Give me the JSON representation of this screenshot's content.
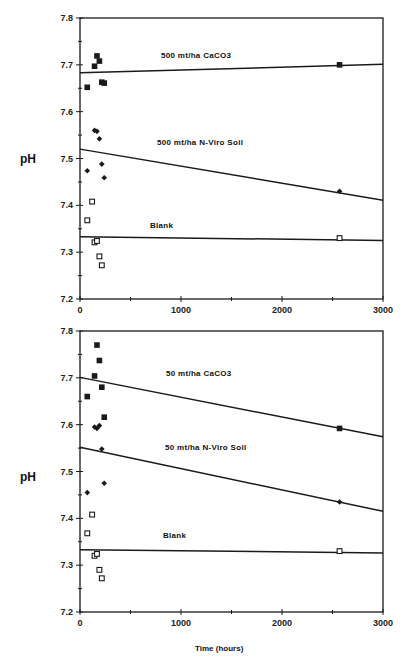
{
  "chart_data": [
    {
      "type": "scatter",
      "title": "",
      "xlabel": "",
      "ylabel": "pH",
      "xlim": [
        0,
        3000
      ],
      "ylim": [
        7.2,
        7.8
      ],
      "xticks": [
        "0",
        "1000",
        "2000",
        "3000"
      ],
      "yticks": [
        "7.2",
        "7.3",
        "7.4",
        "7.5",
        "7.6",
        "7.7",
        "7.8"
      ],
      "grid": false,
      "annotations": [
        "500  mt/ha  CaCO3",
        "500  mt/ha  N-Viro  Soil",
        "Blank"
      ],
      "series": [
        {
          "name": "500 mt/ha CaCO3",
          "marker": "filled-square",
          "x": [
            72,
            144,
            168,
            192,
            216,
            240,
            2570
          ],
          "y": [
            7.652,
            7.697,
            7.719,
            7.708,
            7.663,
            7.661,
            7.7
          ],
          "fit_line": {
            "x": [
              0,
              3000
            ],
            "y": [
              7.683,
              7.701
            ]
          }
        },
        {
          "name": "500 mt/ha N-Viro Soil",
          "marker": "filled-diamond",
          "x": [
            72,
            144,
            168,
            192,
            216,
            240,
            2570
          ],
          "y": [
            7.474,
            7.56,
            7.558,
            7.542,
            7.488,
            7.459,
            7.43
          ],
          "fit_line": {
            "x": [
              0,
              3000
            ],
            "y": [
              7.52,
              7.411
            ]
          }
        },
        {
          "name": "Blank",
          "marker": "open-square",
          "x": [
            72,
            120,
            144,
            168,
            192,
            216,
            2570
          ],
          "y": [
            7.368,
            7.408,
            7.321,
            7.324,
            7.291,
            7.272,
            7.33
          ],
          "fit_line": {
            "x": [
              0,
              3000
            ],
            "y": [
              7.333,
              7.325
            ]
          }
        }
      ]
    },
    {
      "type": "scatter",
      "title": "",
      "xlabel": "Time  (hours)",
      "ylabel": "pH",
      "xlim": [
        0,
        3000
      ],
      "ylim": [
        7.2,
        7.8
      ],
      "xticks": [
        "0",
        "1000",
        "2000",
        "3000"
      ],
      "yticks": [
        "7.2",
        "7.3",
        "7.4",
        "7.5",
        "7.6",
        "7.7",
        "7.8"
      ],
      "grid": false,
      "annotations": [
        "50  mt/ha  CaCO3",
        "50  mt/ha  N-Viro  Soil",
        "Blank"
      ],
      "series": [
        {
          "name": "50 mt/ha CaCO3",
          "marker": "filled-square",
          "x": [
            72,
            144,
            168,
            192,
            216,
            240,
            2570
          ],
          "y": [
            7.66,
            7.704,
            7.77,
            7.737,
            7.68,
            7.616,
            7.592
          ],
          "fit_line": {
            "x": [
              0,
              3000
            ],
            "y": [
              7.701,
              7.574
            ]
          }
        },
        {
          "name": "50 mt/ha N-Viro Soil",
          "marker": "filled-diamond",
          "x": [
            72,
            144,
            168,
            192,
            216,
            240,
            2570
          ],
          "y": [
            7.455,
            7.595,
            7.592,
            7.598,
            7.548,
            7.475,
            7.435
          ],
          "fit_line": {
            "x": [
              0,
              3000
            ],
            "y": [
              7.552,
              7.415
            ]
          }
        },
        {
          "name": "Blank",
          "marker": "open-square",
          "x": [
            72,
            120,
            144,
            168,
            192,
            216,
            2570
          ],
          "y": [
            7.368,
            7.408,
            7.32,
            7.324,
            7.29,
            7.272,
            7.33
          ],
          "fit_line": {
            "x": [
              0,
              3000
            ],
            "y": [
              7.333,
              7.326
            ]
          }
        }
      ]
    }
  ],
  "panels": [
    {
      "ylabel": "pH",
      "labels": {
        "caco3": "500  mt/ha  CaCO3",
        "nviro": "500  mt/ha  N-Viro  Soil",
        "blank": "Blank"
      }
    },
    {
      "ylabel": "pH",
      "labels": {
        "caco3": "50  mt/ha  CaCO3",
        "nviro": "50  mt/ha  N-Viro  Soil",
        "blank": "Blank"
      }
    }
  ],
  "axis": {
    "xticks": [
      "0",
      "1000",
      "2000",
      "3000"
    ],
    "yticks": [
      "7.2",
      "7.3",
      "7.4",
      "7.5",
      "7.6",
      "7.7",
      "7.8"
    ],
    "xlabel": "Time  (hours)"
  },
  "colors": {
    "ink": "#1a1a1a",
    "background": "#ffffff"
  }
}
